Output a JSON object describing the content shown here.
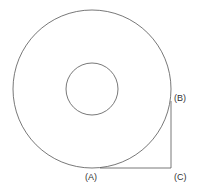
{
  "diagram": {
    "shapes": {
      "outer_circle": {
        "cx": 92,
        "cy": 89,
        "r": 79
      },
      "inner_circle": {
        "cx": 92,
        "cy": 89,
        "r": 26
      },
      "tangent_path": "B-C-A"
    },
    "labels": {
      "a": "(A)",
      "b": "(B)",
      "c": "(C)"
    },
    "colors": {
      "stroke": "#555555",
      "text": "#333333"
    }
  }
}
